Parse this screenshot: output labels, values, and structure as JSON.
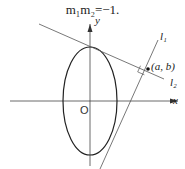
{
  "equation": "m₁m₂=−1.",
  "labels": {
    "y_axis": "y",
    "x_axis": "x",
    "origin": "O",
    "line1": "l₁",
    "line2": "l₂",
    "point": "(a, b)"
  },
  "diagram": {
    "type": "ellipse-with-perpendicular-tangent-lines",
    "ellipse": {
      "center": [
        90,
        101
      ],
      "rx": 27,
      "ry": 54
    },
    "line1_points": [
      [
        100,
        169
      ],
      [
        158,
        40
      ]
    ],
    "line2_points": [
      [
        39,
        24
      ],
      [
        164,
        79
      ]
    ],
    "intersection": [
      148,
      69
    ]
  }
}
